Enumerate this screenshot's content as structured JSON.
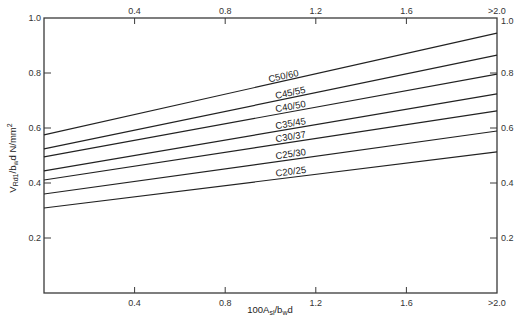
{
  "chart_data": {
    "type": "line",
    "title": "",
    "xlabel": "100A_sl/b_w d",
    "ylabel": "V_Rd1/b_w d N/mm²",
    "xlim": [
      0,
      2.0
    ],
    "ylim": [
      0,
      1.0
    ],
    "grid": false,
    "legend": "inline labels on lines",
    "x_ticks": [
      "0.4",
      "0.8",
      "1.2",
      "1.6",
      ">2.0"
    ],
    "x_tick_values": [
      0.4,
      0.8,
      1.2,
      1.6,
      2.0
    ],
    "y_ticks_left": [
      "0.2",
      "0.4",
      "0.6",
      "0.8",
      "1.0"
    ],
    "y_ticks_right": [
      "0.2",
      "0.4",
      "0.6",
      "0.8",
      "1.0"
    ],
    "y_tick_values": [
      0.2,
      0.4,
      0.6,
      0.8,
      1.0
    ],
    "x": [
      0,
      2.0
    ],
    "series": [
      {
        "name": "C50/60",
        "values": [
          0.575,
          0.945
        ]
      },
      {
        "name": "C45/55",
        "values": [
          0.524,
          0.865
        ]
      },
      {
        "name": "C40/50",
        "values": [
          0.495,
          0.796
        ]
      },
      {
        "name": "C35/45",
        "values": [
          0.444,
          0.724
        ]
      },
      {
        "name": "C30/37",
        "values": [
          0.411,
          0.662
        ]
      },
      {
        "name": "C25/30",
        "values": [
          0.36,
          0.589
        ]
      },
      {
        "name": "C20/25",
        "values": [
          0.309,
          0.513
        ]
      }
    ]
  },
  "axes": {
    "xlabel_parts": {
      "pre": "100A",
      "sub1": "sl",
      "mid": "/b",
      "sub2": "w",
      "post": "d"
    },
    "ylabel_parts": {
      "pre": "V",
      "sub1": "Rd1",
      "mid": "/b",
      "sub2": "w",
      "post": "d N/mm",
      "sup": "2"
    }
  }
}
